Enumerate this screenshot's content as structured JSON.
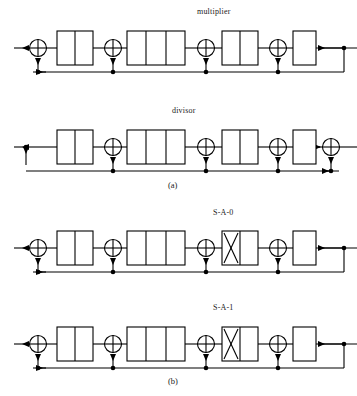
{
  "figure": {
    "labels": {
      "multiplier": "multiplier",
      "divisor": "divisor",
      "sa0": "S-A-0",
      "sa1": "S-A-1"
    },
    "captions": {
      "panel_a": "(a)",
      "panel_b": "(b)"
    },
    "colors": {
      "stroke": "#000000",
      "background": "#ffffff",
      "text": "#1a1a1a"
    },
    "rows": [
      {
        "name": "multiplier",
        "panel": "(a)",
        "label": "multiplier",
        "left_terminal": "output-arrow-left",
        "right_terminal": "input-arrow-left",
        "registers": [
          {
            "cells": 2,
            "fault": null
          },
          {
            "cells": 3,
            "fault": null
          },
          {
            "cells": 2,
            "fault": null
          },
          {
            "cells": 1,
            "fault": null
          }
        ],
        "xor_count": 4,
        "feedback_bus": true
      },
      {
        "name": "divisor",
        "panel": "(a)",
        "label": "divisor",
        "left_terminal": "output-arrow-left-with-tap",
        "right_terminal": "xor-input-right",
        "registers": [
          {
            "cells": 2,
            "fault": null
          },
          {
            "cells": 3,
            "fault": null
          },
          {
            "cells": 2,
            "fault": null
          },
          {
            "cells": 1,
            "fault": null
          }
        ],
        "xor_count": 4,
        "feedback_bus": true
      },
      {
        "name": "stuck-at-0",
        "panel": "(b)",
        "label": "S-A-0",
        "left_terminal": "output-arrow-left",
        "right_terminal": "input-arrow-left",
        "registers": [
          {
            "cells": 2,
            "fault": null
          },
          {
            "cells": 3,
            "fault": null
          },
          {
            "cells": 2,
            "fault": "X"
          },
          {
            "cells": 1,
            "fault": null
          }
        ],
        "xor_count": 4,
        "feedback_bus": true
      },
      {
        "name": "stuck-at-1",
        "panel": "(b)",
        "label": "S-A-1",
        "left_terminal": "output-arrow-left",
        "right_terminal": "input-arrow-left",
        "registers": [
          {
            "cells": 2,
            "fault": null
          },
          {
            "cells": 3,
            "fault": null
          },
          {
            "cells": 2,
            "fault": "X"
          },
          {
            "cells": 1,
            "fault": null
          }
        ],
        "xor_count": 4,
        "feedback_bus": true
      }
    ]
  }
}
